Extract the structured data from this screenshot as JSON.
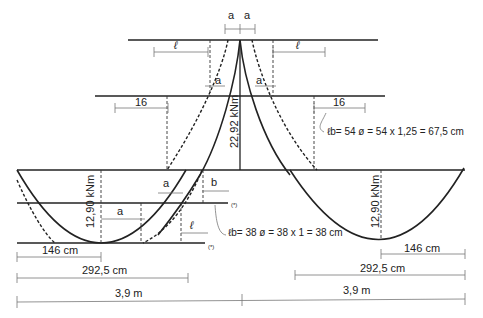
{
  "diagram": {
    "type": "bending-moment-diagram-with-rebar-anchorage",
    "colors": {
      "line": "#222222",
      "dim": "#777777",
      "background": "#ffffff"
    },
    "labels": {
      "a_l": "a",
      "a_l_sub": "ℓ",
      "l_b": "ℓ",
      "l_b_sub": "b",
      "b_l": "b",
      "b_l_sub": "ℓ",
      "hogging_moment": "22,92 kNm",
      "sagging_moment_left": "12,90 kNm",
      "sagging_moment_right": "12,90 kNm",
      "dim_16_left": "16",
      "dim_16_right": "16",
      "formula_top": "ℓb= 54 ø = 54 x 1,25 = 67,5 cm",
      "formula_bottom": "ℓb= 38 ø = 38 x 1 = 38 cm",
      "note_marker_1": "(*)",
      "note_marker_2": "(*)"
    },
    "dimensions": {
      "left_146": "146 cm",
      "left_292": "292,5 cm",
      "left_span": "3,9 m",
      "right_146": "146 cm",
      "right_292": "292,5 cm",
      "right_span": "3,9 m"
    }
  }
}
